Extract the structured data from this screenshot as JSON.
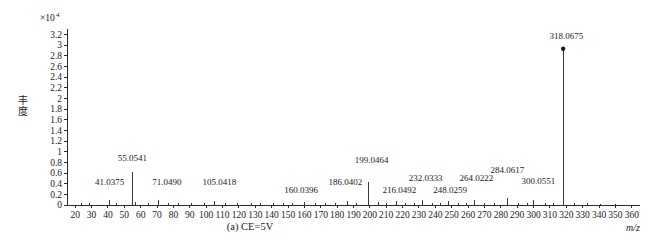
{
  "figure": {
    "caption": "(a) CE=5V",
    "y_axis_label": "丰度",
    "y_axis_multiplier": "×10",
    "y_axis_multiplier_exponent": "4",
    "x_axis_label": "m/z"
  },
  "chart_data": {
    "type": "bar",
    "title": "(a) CE=5V",
    "subtitle": "",
    "xlabel": "m/z",
    "ylabel": "丰度",
    "y_scale_factor": 10000,
    "y_scale_text": "×10⁴",
    "xlim": [
      15,
      365
    ],
    "ylim": [
      0,
      3.3
    ],
    "grid": false,
    "legend": "none",
    "xticks": [
      20,
      30,
      40,
      50,
      60,
      70,
      80,
      90,
      100,
      110,
      120,
      130,
      140,
      150,
      160,
      170,
      180,
      190,
      200,
      210,
      220,
      230,
      240,
      250,
      260,
      270,
      280,
      290,
      300,
      310,
      320,
      330,
      340,
      350,
      360
    ],
    "yticks": [
      0,
      0.2,
      0.4,
      0.6,
      0.8,
      1,
      1.2,
      1.4,
      1.6,
      1.8,
      2,
      2.2,
      2.4,
      2.6,
      2.8,
      3,
      3.2
    ],
    "ytick_labels": [
      "0",
      "0.2",
      "0.4",
      "0.6",
      "0.8",
      "1",
      "1.2",
      "1.4",
      "1.6",
      "1.8",
      "2",
      "2.2",
      "2.4",
      "2.6",
      "2.8",
      "3",
      "3.2"
    ],
    "annotations": [
      {
        "label": "41.0375",
        "mz": 41.0375,
        "intensity": 0.1,
        "label_x": 41,
        "label_y": 0.38
      },
      {
        "label": "55.0541",
        "mz": 55.0541,
        "intensity": 0.62,
        "label_x": 55,
        "label_y": 0.83
      },
      {
        "label": "71.0490",
        "mz": 71.049,
        "intensity": 0.09,
        "label_x": 76,
        "label_y": 0.38
      },
      {
        "label": "105.0418",
        "mz": 105.0418,
        "intensity": 0.07,
        "label_x": 108,
        "label_y": 0.38
      },
      {
        "label": "160.0396",
        "mz": 160.0396,
        "intensity": 0.06,
        "label_x": 158,
        "label_y": 0.23
      },
      {
        "label": "186.0402",
        "mz": 186.0402,
        "intensity": 0.07,
        "label_x": 185,
        "label_y": 0.38
      },
      {
        "label": "199.0464",
        "mz": 199.0464,
        "intensity": 0.44,
        "label_x": 201,
        "label_y": 0.78
      },
      {
        "label": "216.0492",
        "mz": 216.0492,
        "intensity": 0.08,
        "label_x": 218,
        "label_y": 0.23
      },
      {
        "label": "232.0333",
        "mz": 232.0333,
        "intensity": 0.1,
        "label_x": 234,
        "label_y": 0.45
      },
      {
        "label": "248.0259",
        "mz": 248.0259,
        "intensity": 0.08,
        "label_x": 249,
        "label_y": 0.23
      },
      {
        "label": "264.0222",
        "mz": 264.0222,
        "intensity": 0.09,
        "label_x": 265,
        "label_y": 0.45
      },
      {
        "label": "284.0617",
        "mz": 284.0617,
        "intensity": 0.13,
        "label_x": 284,
        "label_y": 0.6
      },
      {
        "label": "300.0551",
        "mz": 300.0551,
        "intensity": 0.09,
        "label_x": 303,
        "label_y": 0.4
      },
      {
        "label": "318.0675",
        "mz": 318.0675,
        "intensity": 2.93,
        "label_x": 320,
        "label_y": 3.12
      }
    ],
    "peaks": [
      {
        "mz": 24.0,
        "intensity": 0.03
      },
      {
        "mz": 29.0,
        "intensity": 0.04
      },
      {
        "mz": 41.0375,
        "intensity": 0.1
      },
      {
        "mz": 45.0,
        "intensity": 0.04
      },
      {
        "mz": 55.0541,
        "intensity": 0.62
      },
      {
        "mz": 57.0,
        "intensity": 0.05
      },
      {
        "mz": 65.0,
        "intensity": 0.04
      },
      {
        "mz": 71.049,
        "intensity": 0.09
      },
      {
        "mz": 77.0,
        "intensity": 0.04
      },
      {
        "mz": 83.0,
        "intensity": 0.03
      },
      {
        "mz": 91.0,
        "intensity": 0.04
      },
      {
        "mz": 99.0,
        "intensity": 0.03
      },
      {
        "mz": 105.0418,
        "intensity": 0.07
      },
      {
        "mz": 112.0,
        "intensity": 0.03
      },
      {
        "mz": 119.0,
        "intensity": 0.04
      },
      {
        "mz": 128.0,
        "intensity": 0.03
      },
      {
        "mz": 133.0,
        "intensity": 0.03
      },
      {
        "mz": 141.0,
        "intensity": 0.03
      },
      {
        "mz": 147.0,
        "intensity": 0.04
      },
      {
        "mz": 153.0,
        "intensity": 0.03
      },
      {
        "mz": 160.0396,
        "intensity": 0.06
      },
      {
        "mz": 167.0,
        "intensity": 0.03
      },
      {
        "mz": 173.0,
        "intensity": 0.04
      },
      {
        "mz": 179.0,
        "intensity": 0.03
      },
      {
        "mz": 186.0402,
        "intensity": 0.07
      },
      {
        "mz": 192.0,
        "intensity": 0.04
      },
      {
        "mz": 199.0464,
        "intensity": 0.44
      },
      {
        "mz": 205.0,
        "intensity": 0.05
      },
      {
        "mz": 210.0,
        "intensity": 0.04
      },
      {
        "mz": 216.0492,
        "intensity": 0.08
      },
      {
        "mz": 222.0,
        "intensity": 0.04
      },
      {
        "mz": 227.0,
        "intensity": 0.03
      },
      {
        "mz": 232.0333,
        "intensity": 0.1
      },
      {
        "mz": 238.0,
        "intensity": 0.04
      },
      {
        "mz": 243.0,
        "intensity": 0.03
      },
      {
        "mz": 248.0259,
        "intensity": 0.08
      },
      {
        "mz": 254.0,
        "intensity": 0.04
      },
      {
        "mz": 259.0,
        "intensity": 0.03
      },
      {
        "mz": 264.0222,
        "intensity": 0.09
      },
      {
        "mz": 270.0,
        "intensity": 0.04
      },
      {
        "mz": 276.0,
        "intensity": 0.03
      },
      {
        "mz": 284.0617,
        "intensity": 0.13
      },
      {
        "mz": 291.0,
        "intensity": 0.04
      },
      {
        "mz": 296.0,
        "intensity": 0.03
      },
      {
        "mz": 300.0551,
        "intensity": 0.09
      },
      {
        "mz": 307.0,
        "intensity": 0.03
      },
      {
        "mz": 312.0,
        "intensity": 0.04
      },
      {
        "mz": 318.0675,
        "intensity": 2.93
      },
      {
        "mz": 325.0,
        "intensity": 0.03
      },
      {
        "mz": 333.0,
        "intensity": 0.03
      },
      {
        "mz": 341.0,
        "intensity": 0.02
      },
      {
        "mz": 350.0,
        "intensity": 0.02
      }
    ]
  }
}
